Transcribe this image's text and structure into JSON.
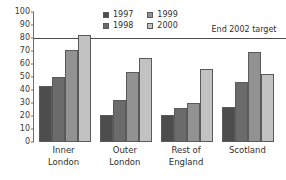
{
  "chart_data": {
    "type": "bar",
    "title": "",
    "xlabel": "",
    "ylabel": "",
    "ylim": [
      0,
      100
    ],
    "y_ticks": [
      0,
      10,
      20,
      30,
      40,
      50,
      60,
      70,
      80,
      90,
      100
    ],
    "grid": false,
    "legend_position": "top-center",
    "categories": [
      "Inner\nLondon",
      "Outer\nLondon",
      "Rest of\nEngland",
      "Scotland"
    ],
    "series": [
      {
        "name": "1997",
        "color": "#4d4d4d",
        "values": [
          43,
          21,
          21,
          27
        ]
      },
      {
        "name": "1998",
        "color": "#6b6b6b",
        "values": [
          50,
          32,
          26,
          46
        ]
      },
      {
        "name": "1999",
        "color": "#929292",
        "values": [
          71,
          54,
          30,
          69
        ]
      },
      {
        "name": "2000",
        "color": "#c2c2c2",
        "values": [
          82,
          65,
          56,
          52
        ]
      }
    ],
    "annotations": [
      {
        "name": "end-2002-target",
        "label": "End 2002\ntarget",
        "value": 80,
        "type": "horizontal-line",
        "color": "#4a4a4a"
      }
    ]
  }
}
